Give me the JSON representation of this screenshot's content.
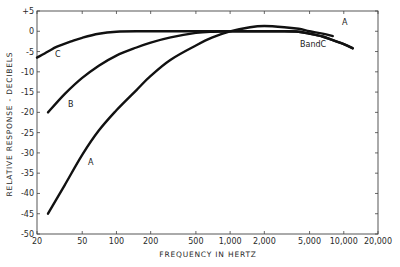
{
  "chart_data": {
    "type": "line",
    "title": "",
    "xlabel": "FREQUENCY IN HERTZ",
    "ylabel": "RELATIVE RESPONSE - DECIBELS",
    "xscale": "log",
    "xlim": [
      20,
      20000
    ],
    "ylim": [
      -50,
      5
    ],
    "grid": false,
    "legend": "inline curve labels",
    "x_ticks": [
      20,
      50,
      100,
      200,
      500,
      1000,
      2000,
      5000,
      10000,
      20000
    ],
    "x_tick_labels": [
      "20",
      "50",
      "100",
      "200",
      "500",
      "1,000",
      "2,000",
      "5,000",
      "10,000",
      "20,000"
    ],
    "y_ticks": [
      5,
      0,
      -5,
      -10,
      -15,
      -20,
      -25,
      -30,
      -35,
      -40,
      -45,
      -50
    ],
    "y_tick_labels": [
      "+5",
      "0",
      "-5",
      "-10",
      "-15",
      "-20",
      "-25",
      "-30",
      "-35",
      "-40",
      "-45",
      "-50"
    ],
    "series": [
      {
        "name": "A",
        "label_positions": [
          {
            "text": "A",
            "freq": 9000,
            "db": 2.2
          },
          {
            "text": "A",
            "freq": 65,
            "db": -32
          }
        ],
        "x": [
          25,
          35,
          50,
          70,
          100,
          150,
          200,
          300,
          500,
          700,
          1000,
          1500,
          2000,
          3000,
          4000,
          5000,
          6500,
          8000
        ],
        "y": [
          -45,
          -38,
          -30.5,
          -24.5,
          -19.5,
          -14.5,
          -11,
          -7,
          -3.5,
          -1.5,
          0,
          1.0,
          1.3,
          1.0,
          0.6,
          0,
          -0.6,
          -1.2
        ]
      },
      {
        "name": "B",
        "label_positions": [
          {
            "text": "B",
            "freq": 40,
            "db": -17
          },
          {
            "text": "B and C",
            "freq": 6500,
            "db": -2.8
          }
        ],
        "x": [
          25,
          35,
          50,
          70,
          100,
          150,
          200,
          300,
          500,
          700,
          1000,
          2000,
          3000,
          4000,
          5000,
          6500,
          8000,
          10000,
          12000
        ],
        "y": [
          -20,
          -15.5,
          -11.5,
          -8.5,
          -6,
          -4,
          -2.8,
          -1.5,
          -0.4,
          -0.1,
          0,
          0,
          0,
          -0.1,
          -0.6,
          -1.3,
          -2.2,
          -3.2,
          -4.2
        ]
      },
      {
        "name": "C",
        "label_positions": [
          {
            "text": "C",
            "freq": 30,
            "db": -4
          },
          {
            "text": "B and C",
            "freq": 6500,
            "db": -2.8
          }
        ],
        "x": [
          20,
          25,
          30,
          40,
          50,
          70,
          100,
          150,
          200,
          500,
          1000,
          2000,
          3000,
          4000,
          5000,
          6500,
          8000,
          10000,
          12000
        ],
        "y": [
          -6.5,
          -5,
          -3.8,
          -2.5,
          -1.6,
          -0.6,
          -0.1,
          0,
          0,
          0,
          0,
          0,
          0,
          -0.1,
          -0.6,
          -1.3,
          -2.2,
          -3.2,
          -4.2
        ]
      }
    ],
    "annotations": [
      "A",
      "B",
      "C",
      "A",
      "BandC"
    ]
  },
  "labels": {
    "ylabel": "RELATIVE RESPONSE - DECIBELS",
    "xlabel": "FREQUENCY IN HERTZ",
    "curve_A_top": "A",
    "curve_A_bottom": "A",
    "curve_B": "B",
    "curve_C": "C",
    "curve_BandC": "BandC"
  }
}
